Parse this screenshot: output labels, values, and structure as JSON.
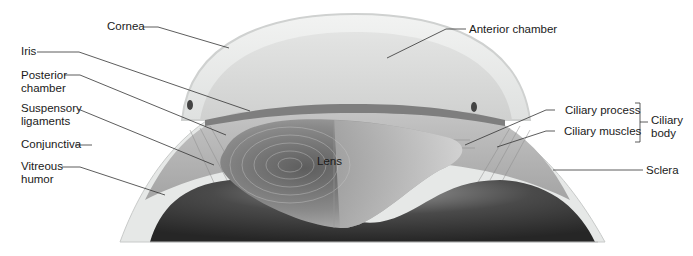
{
  "diagram": {
    "colors": {
      "background": "#ffffff",
      "label_text": "#1a1a1a",
      "leader_line": "#333333",
      "cornea": "#e9ebea",
      "anterior_chamber": "#dcdedd",
      "iris": "#8d8d8d",
      "lens": "#7a7a7a",
      "vitreous": "#3a3a3a",
      "sclera": "#cfd1d0"
    },
    "labels": {
      "cornea": "Cornea",
      "anterior_chamber": "Anterior chamber",
      "iris": "Iris",
      "posterior_chamber_1": "Posterior",
      "posterior_chamber_2": "chamber",
      "suspensory_ligaments_1": "Suspensory",
      "suspensory_ligaments_2": "ligaments",
      "conjunctiva": "Conjunctiva",
      "vitreous_humor_1": "Vitreous",
      "vitreous_humor_2": "humor",
      "lens": "Lens",
      "ciliary_process": "Ciliary process",
      "ciliary_muscles": "Ciliary muscles",
      "ciliary_body_1": "Ciliary",
      "ciliary_body_2": "body",
      "sclera": "Sclera"
    }
  }
}
